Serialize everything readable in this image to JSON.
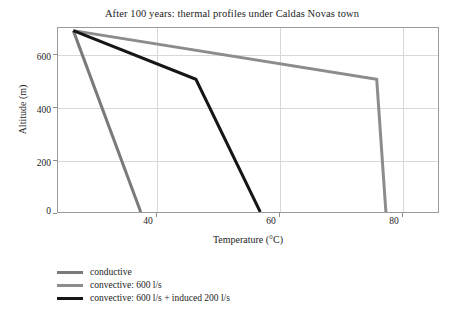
{
  "chart_data": {
    "type": "line",
    "title": "After 100 years: thermal profiles under Caldas Novas town",
    "xlabel": "Temperature (°C)",
    "ylabel": "Altitude (m)",
    "xlim": [
      24,
      86
    ],
    "ylim": [
      0,
      700
    ],
    "xticks": [
      40,
      60,
      80
    ],
    "yticks": [
      0,
      200,
      400,
      600
    ],
    "grid": true,
    "legend_position": "below-plot",
    "series": [
      {
        "name": "conductive",
        "color": "#7a7a7a",
        "width": 3,
        "points": [
          {
            "x": 26.5,
            "y": 690
          },
          {
            "x": 37.5,
            "y": 0
          }
        ]
      },
      {
        "name": "convective: 600 l/s",
        "color": "#8c8c8c",
        "width": 3,
        "points": [
          {
            "x": 26.5,
            "y": 690
          },
          {
            "x": 76.0,
            "y": 505
          },
          {
            "x": 77.5,
            "y": 0
          }
        ]
      },
      {
        "name": "convective: 600 l/s + induced 200 l/s",
        "color": "#161616",
        "width": 3,
        "points": [
          {
            "x": 26.5,
            "y": 690
          },
          {
            "x": 46.5,
            "y": 505
          },
          {
            "x": 57.0,
            "y": 0
          }
        ]
      }
    ]
  },
  "legend": {
    "items": [
      {
        "label": "conductive",
        "color": "#7a7a7a"
      },
      {
        "label": "convective: 600 l/s",
        "color": "#8c8c8c"
      },
      {
        "label": "convective: 600 l/s + induced 200 l/s",
        "color": "#161616"
      }
    ]
  },
  "ticks": {
    "y": [
      "0",
      "200",
      "400",
      "600"
    ],
    "x": [
      "40",
      "60",
      "80"
    ]
  }
}
